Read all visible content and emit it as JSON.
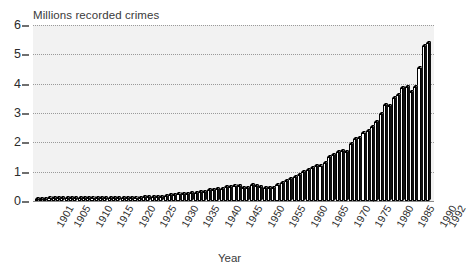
{
  "chart_data": {
    "type": "bar",
    "title": "Millions recorded crimes",
    "subtitle": "",
    "xlabel": "Year",
    "ylabel": "Millions recorded crimes",
    "ylim": [
      0,
      6
    ],
    "y_ticks": [
      0,
      1,
      2,
      3,
      4,
      5,
      6
    ],
    "y_tick_labels": [
      "0",
      "1",
      "2",
      "3",
      "4",
      "5",
      "6"
    ],
    "grid": true,
    "legend": false,
    "legend_position": "none",
    "x_tick_labels": [
      "1901",
      "1905",
      "1910",
      "1915",
      "1920",
      "1925",
      "1930",
      "1935",
      "1940",
      "1945",
      "1950",
      "1955",
      "1960",
      "1965",
      "1970",
      "1975",
      "1980",
      "1985",
      "1990",
      "1992"
    ],
    "x_tick_years": [
      1901,
      1905,
      1910,
      1915,
      1920,
      1925,
      1930,
      1935,
      1940,
      1945,
      1950,
      1955,
      1960,
      1965,
      1970,
      1975,
      1980,
      1985,
      1990,
      1992
    ],
    "categories": [
      1901,
      1902,
      1903,
      1904,
      1905,
      1906,
      1907,
      1908,
      1909,
      1910,
      1911,
      1912,
      1913,
      1914,
      1915,
      1916,
      1917,
      1918,
      1919,
      1920,
      1921,
      1922,
      1923,
      1924,
      1925,
      1926,
      1927,
      1928,
      1929,
      1930,
      1931,
      1932,
      1933,
      1934,
      1935,
      1936,
      1937,
      1938,
      1939,
      1940,
      1941,
      1942,
      1943,
      1944,
      1945,
      1946,
      1947,
      1948,
      1949,
      1950,
      1951,
      1952,
      1953,
      1954,
      1955,
      1956,
      1957,
      1958,
      1959,
      1960,
      1961,
      1962,
      1963,
      1964,
      1965,
      1966,
      1967,
      1968,
      1969,
      1970,
      1971,
      1972,
      1973,
      1974,
      1975,
      1976,
      1977,
      1978,
      1979,
      1980,
      1981,
      1982,
      1983,
      1984,
      1985,
      1986,
      1987,
      1988,
      1989,
      1990,
      1991,
      1992
    ],
    "values": [
      0.08,
      0.08,
      0.08,
      0.09,
      0.09,
      0.09,
      0.09,
      0.1,
      0.1,
      0.1,
      0.1,
      0.1,
      0.1,
      0.1,
      0.1,
      0.1,
      0.1,
      0.1,
      0.11,
      0.11,
      0.11,
      0.11,
      0.11,
      0.11,
      0.11,
      0.12,
      0.12,
      0.13,
      0.14,
      0.15,
      0.16,
      0.21,
      0.21,
      0.23,
      0.23,
      0.24,
      0.26,
      0.28,
      0.3,
      0.31,
      0.36,
      0.39,
      0.41,
      0.42,
      0.48,
      0.47,
      0.5,
      0.52,
      0.46,
      0.46,
      0.53,
      0.51,
      0.47,
      0.44,
      0.44,
      0.45,
      0.55,
      0.63,
      0.67,
      0.74,
      0.81,
      0.9,
      0.98,
      1.07,
      1.13,
      1.2,
      1.21,
      1.29,
      1.49,
      1.57,
      1.67,
      1.69,
      1.66,
      1.96,
      2.11,
      2.14,
      2.32,
      2.39,
      2.54,
      2.69,
      2.96,
      3.27,
      3.25,
      3.5,
      3.61,
      3.85,
      3.89,
      3.72,
      3.87,
      4.54,
      5.28,
      5.39
    ],
    "units": "millions",
    "n_bars": 92,
    "style": "3d-white-bars-black-outline"
  },
  "figure": {
    "background_color": "#ffffff",
    "plot_background_color": "#f2f2f2",
    "gridline_color": "#9a9a9a",
    "axis_color": "#8a8a8a",
    "bar_face_color": "#ffffff",
    "bar_edge_color": "#000000",
    "text_color": "#2b2b2b"
  }
}
